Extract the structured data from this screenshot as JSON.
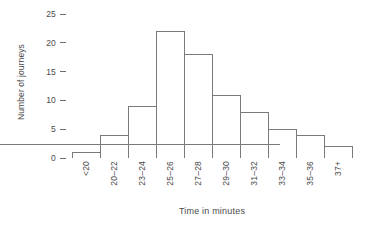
{
  "chart_data": {
    "type": "bar",
    "title": "",
    "subtitle": "",
    "xlabel": "Time in minutes",
    "ylabel": "Number of journeys",
    "categories": [
      "<20",
      "20–22",
      "23–24",
      "25–26",
      "27–28",
      "29–30",
      "31–32",
      "33–34",
      "35–36",
      "37+"
    ],
    "values": [
      1,
      4,
      9,
      22,
      18,
      11,
      8,
      5,
      4,
      2
    ],
    "ylim": [
      0,
      25
    ],
    "yticks": [
      0,
      5,
      10,
      15,
      20,
      25
    ],
    "ytick_labels": [
      "0",
      "5",
      "10",
      "15",
      "20",
      "25"
    ],
    "xlim_categorical": true,
    "grid": false,
    "legend": null,
    "annotations": [],
    "bar_fill_color": "#ffffff",
    "bar_edge_color": "#7a7a7a",
    "axis_color": "#6d6d6d",
    "text_color": "#4a4a4a",
    "background_color": "#ffffff"
  }
}
